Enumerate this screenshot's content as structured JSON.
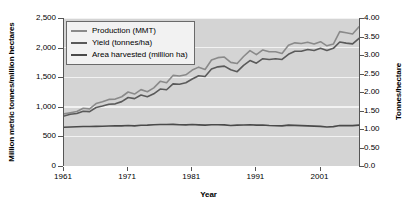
{
  "chart_data": {
    "type": "line",
    "title": "",
    "xlabel": "Year",
    "ylabel": "Million metric tonnes/million hectares",
    "ylabel_right": "Tonnes/hectare",
    "grid": true,
    "legend_position": "top-left",
    "xlim": [
      1961,
      2007
    ],
    "ylim": [
      0,
      2500
    ],
    "ylim_right": [
      0,
      4.0
    ],
    "xticks": [
      "1961",
      "1971",
      "1981",
      "1991",
      "2001"
    ],
    "xtick_values": [
      1961,
      1971,
      1981,
      1991,
      2001
    ],
    "yticks_left": [
      "0",
      "500",
      "1,000",
      "1,500",
      "2,000",
      "2,500"
    ],
    "ytick_values_left": [
      0,
      500,
      1000,
      1500,
      2000,
      2500
    ],
    "yticks_right": [
      "0.0",
      "0.50",
      "1.00",
      "1.50",
      "2.00",
      "2.50",
      "3.00",
      "3.50",
      "4.00"
    ],
    "ytick_values_right": [
      0,
      0.5,
      1.0,
      1.5,
      2.0,
      2.5,
      3.0,
      3.5,
      4.0
    ],
    "x": [
      1961,
      1962,
      1963,
      1964,
      1965,
      1966,
      1967,
      1968,
      1969,
      1970,
      1971,
      1972,
      1973,
      1974,
      1975,
      1976,
      1977,
      1978,
      1979,
      1980,
      1981,
      1982,
      1983,
      1984,
      1985,
      1986,
      1987,
      1988,
      1989,
      1990,
      1991,
      1992,
      1993,
      1994,
      1995,
      1996,
      1997,
      1998,
      1999,
      2000,
      2001,
      2002,
      2003,
      2004,
      2005,
      2006,
      2007
    ],
    "series": [
      {
        "name": "Production (MMT)",
        "axis": "left",
        "color": "#8a8a8a",
        "unit": "MMT",
        "values": [
          880,
          900,
          920,
          975,
          965,
          1055,
          1085,
          1125,
          1130,
          1170,
          1250,
          1215,
          1290,
          1255,
          1320,
          1430,
          1405,
          1530,
          1520,
          1540,
          1620,
          1670,
          1630,
          1790,
          1830,
          1840,
          1750,
          1730,
          1850,
          1950,
          1880,
          1960,
          1930,
          1930,
          1900,
          2040,
          2080,
          2070,
          2090,
          2060,
          2100,
          2030,
          2060,
          2270,
          2250,
          2230,
          2350
        ]
      },
      {
        "name": "Yield (tonnes/ha)",
        "axis": "right",
        "color": "#5a5a5a",
        "unit": "tonnes/ha",
        "values": [
          1.35,
          1.4,
          1.42,
          1.48,
          1.47,
          1.58,
          1.62,
          1.67,
          1.68,
          1.74,
          1.85,
          1.82,
          1.92,
          1.87,
          1.95,
          2.08,
          2.06,
          2.22,
          2.21,
          2.25,
          2.35,
          2.44,
          2.42,
          2.62,
          2.68,
          2.7,
          2.6,
          2.55,
          2.72,
          2.85,
          2.78,
          2.9,
          2.88,
          2.9,
          2.88,
          3.02,
          3.1,
          3.1,
          3.15,
          3.12,
          3.18,
          3.12,
          3.18,
          3.35,
          3.32,
          3.3,
          3.45
        ]
      },
      {
        "name": "Area harvested (million ha)",
        "axis": "left",
        "color": "#4a4a4a",
        "unit": "million ha",
        "values": [
          655,
          660,
          663,
          668,
          668,
          670,
          672,
          676,
          678,
          678,
          683,
          678,
          688,
          690,
          698,
          700,
          700,
          703,
          698,
          695,
          700,
          695,
          690,
          697,
          696,
          694,
          685,
          690,
          693,
          697,
          690,
          692,
          683,
          680,
          678,
          690,
          686,
          682,
          678,
          673,
          670,
          660,
          665,
          683,
          682,
          682,
          690
        ]
      }
    ]
  },
  "legend": {
    "items": [
      {
        "label": "Production (MMT)",
        "color": "#8a8a8a"
      },
      {
        "label": "Yield (tonnes/ha)",
        "color": "#5a5a5a"
      },
      {
        "label": "Area harvested (million ha)",
        "color": "#4a4a4a"
      }
    ]
  },
  "axes": {
    "x_title": "Year",
    "y_left_title": "Million metric tonnes/million hectares",
    "y_right_title": "Tonnes/hectare"
  },
  "colors": {
    "plot_background": "#d4d4d4",
    "gridline": "#f2f2f2",
    "axis": "#555555",
    "text": "#000000",
    "legend_background": "#f2f2f2",
    "legend_border": "#6a6a6a"
  }
}
